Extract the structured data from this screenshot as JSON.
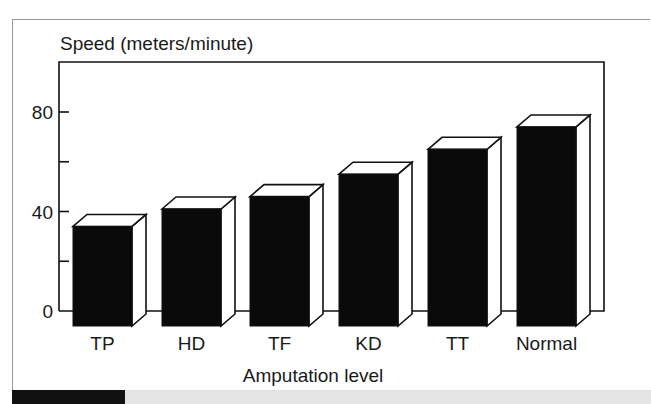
{
  "chart_data": {
    "type": "bar",
    "title": "",
    "ylabel": "Speed (meters/minute)",
    "xlabel": "Amputation level",
    "categories": [
      "TP",
      "HD",
      "TF",
      "KD",
      "TT",
      "Normal"
    ],
    "values": [
      34,
      41,
      46,
      55,
      65,
      74
    ],
    "ylim": [
      0,
      100
    ],
    "yticks": [
      0,
      20,
      40,
      60,
      80
    ],
    "ytick_labels": [
      "0",
      "",
      "40",
      "",
      "80"
    ],
    "grid": false,
    "style": "3d-bar",
    "bar_color": "#0a0a0a",
    "legend": null
  }
}
